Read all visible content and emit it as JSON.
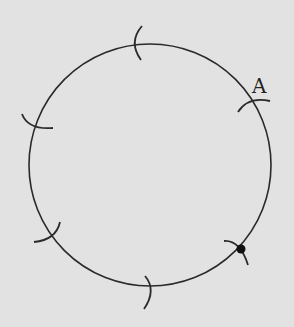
{
  "diagram": {
    "background": "#e2e2e2",
    "stroke": "#2a2a2a",
    "circle": {
      "cx": 150,
      "cy": 165,
      "r": 121
    },
    "point_label": "A",
    "marked_point": {
      "x": 241,
      "y": 249
    },
    "arcs": [
      {
        "name": "arc-A",
        "x": 252,
        "y": 97
      },
      {
        "name": "arc-top",
        "x": 137,
        "y": 41
      },
      {
        "name": "arc-left",
        "x": 36,
        "y": 128
      },
      {
        "name": "arc-bottom-left",
        "x": 50,
        "y": 236
      },
      {
        "name": "arc-bottom",
        "x": 148,
        "y": 289
      },
      {
        "name": "arc-bottom-right",
        "x": 241,
        "y": 249
      }
    ]
  }
}
